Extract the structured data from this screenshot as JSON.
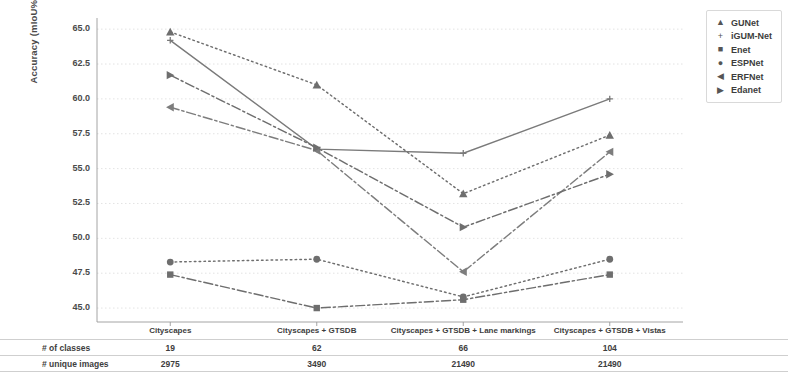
{
  "chart_data": {
    "type": "line",
    "title": "",
    "xlabel": "",
    "ylabel": "Accuracy (mIoU%)",
    "categories": [
      "Cityscapes",
      "Cityscapes + GTSDB",
      "Cityscapes + GTSDB + Lane markings",
      "Cityscapes + GTSDB + Vistas"
    ],
    "ylim": [
      44.0,
      65.8
    ],
    "yticks": [
      45.0,
      47.5,
      50.0,
      52.5,
      55.0,
      57.5,
      60.0,
      62.5,
      65.0
    ],
    "ytick_labels": [
      "45.0",
      "47.5",
      "50.0",
      "52.5",
      "55.0",
      "57.5",
      "60.0",
      "62.5",
      "65.0"
    ],
    "grid": true,
    "legend_position": "top-right",
    "series": [
      {
        "name": "GUNet",
        "marker": "triangle-up",
        "linestyle": "dotted",
        "color": "#6e6e6e",
        "values": [
          64.8,
          61.0,
          53.2,
          57.4
        ]
      },
      {
        "name": "iGUM-Net",
        "marker": "plus",
        "linestyle": "solid",
        "color": "#7a7a7a",
        "values": [
          64.2,
          56.4,
          56.1,
          60.0
        ]
      },
      {
        "name": "Enet",
        "marker": "square",
        "linestyle": "dashdot",
        "color": "#6e6e6e",
        "values": [
          47.4,
          45.0,
          45.6,
          47.4
        ]
      },
      {
        "name": "ESPNet",
        "marker": "circle",
        "linestyle": "dotted",
        "color": "#6e6e6e",
        "values": [
          48.3,
          48.5,
          45.8,
          48.5
        ]
      },
      {
        "name": "ERFNet",
        "marker": "triangle-left",
        "linestyle": "dashdot",
        "color": "#7d7d7d",
        "values": [
          59.4,
          56.3,
          47.6,
          56.2
        ]
      },
      {
        "name": "Edanet",
        "marker": "triangle-right",
        "linestyle": "dashdot",
        "color": "#6e6e6e",
        "values": [
          61.7,
          56.5,
          50.8,
          54.6
        ]
      }
    ],
    "annotation_table": {
      "rows": [
        {
          "label": "# of classes",
          "values": [
            "19",
            "62",
            "66",
            "104"
          ]
        },
        {
          "label": "# unique images",
          "values": [
            "2975",
            "3490",
            "21490",
            "21490"
          ]
        }
      ]
    }
  },
  "legend": {
    "items": [
      {
        "label": "GUNet",
        "glyph": "▲"
      },
      {
        "label": "iGUM-Net",
        "glyph": "+"
      },
      {
        "label": "Enet",
        "glyph": "■"
      },
      {
        "label": "ESPNet",
        "glyph": "●"
      },
      {
        "label": "ERFNet",
        "glyph": "◀"
      },
      {
        "label": "Edanet",
        "glyph": "▶"
      }
    ]
  }
}
